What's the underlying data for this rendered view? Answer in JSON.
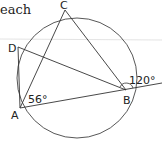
{
  "partial_text": "each",
  "points": {
    "A": {
      "label": "A",
      "x": 20,
      "y": 108
    },
    "B": {
      "label": "B",
      "x": 126,
      "y": 90
    },
    "C": {
      "label": "C",
      "x": 65,
      "y": 10
    },
    "D": {
      "label": "D",
      "x": 18,
      "y": 47
    }
  },
  "angles": {
    "at_A": "56°",
    "exterior_B": "120°"
  },
  "circle": {
    "cx": 77,
    "cy": 78,
    "r": 60
  },
  "colors": {
    "stroke": "#333333",
    "guide": "#d8d8d8"
  }
}
